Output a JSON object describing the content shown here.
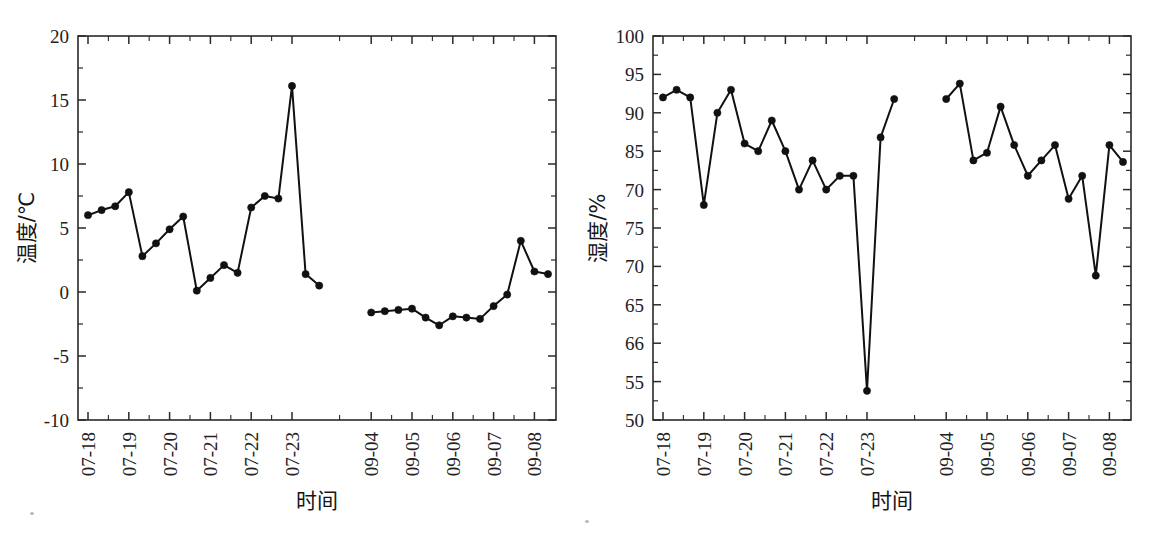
{
  "figure": {
    "background_color": "#ffffff",
    "line_color": "#111111",
    "marker_color": "#111111",
    "axis_color": "#2a2a2a",
    "panel_count": 2
  },
  "chart_data": [
    {
      "type": "line",
      "panel": "left",
      "title": "",
      "xlabel": "时间",
      "ylabel": "温度/℃",
      "ylim": [
        -10,
        20
      ],
      "ytick_labels": [
        "20",
        "15",
        "10",
        "5",
        "0",
        "-5",
        "-10"
      ],
      "ytick_values": [
        20,
        15,
        10,
        5,
        0,
        -5,
        -10
      ],
      "xtick_labels": [
        "07-18",
        "07-19",
        "07-20",
        "07-21",
        "07-22",
        "07-23",
        "09-04",
        "09-05",
        "09-06",
        "09-07",
        "09-08"
      ],
      "grid": false,
      "legend": "none",
      "marker": "filled-circle",
      "has_gap": true,
      "series": [
        {
          "name": "温度 (07-18 ~ 07-23)",
          "segment": 1,
          "x": [
            0.0,
            0.28,
            0.56,
            0.78,
            1.0,
            1.25,
            1.5,
            1.75,
            2.0,
            2.25,
            2.5,
            2.75,
            3.0,
            3.25,
            3.5,
            3.75,
            4.0,
            4.25,
            4.5,
            4.75,
            5.0,
            5.25,
            5.5
          ],
          "values": [
            6.0,
            6.4,
            6.7,
            7.8,
            2.8,
            3.8,
            4.9,
            5.9,
            0.1,
            1.1,
            2.1,
            1.5,
            6.6,
            7.5,
            7.3,
            16.1,
            1.4,
            0.5
          ]
        },
        {
          "name": "温度 (09-04 ~ 09-08)",
          "segment": 2,
          "values": [
            -1.6,
            -1.5,
            -1.4,
            -1.3,
            -2.0,
            -2.6,
            -1.9,
            -2.0,
            -2.1,
            -1.1,
            -0.2,
            4.0,
            1.6,
            1.4
          ]
        }
      ]
    },
    {
      "type": "line",
      "panel": "right",
      "title": "",
      "xlabel": "时间",
      "ylabel": "湿度/%",
      "ylim": [
        50,
        100
      ],
      "ytick_labels": [
        "100",
        "95",
        "90",
        "85",
        "70",
        "75",
        "70",
        "65",
        "66",
        "55",
        "50"
      ],
      "ytick_values": [
        100,
        95,
        90,
        85,
        80,
        75,
        70,
        65,
        60,
        55,
        50
      ],
      "xtick_labels": [
        "07-18",
        "07-19",
        "07-20",
        "07-21",
        "07-22",
        "07-23",
        "09-04",
        "09-05",
        "09-06",
        "09-07",
        "09-08"
      ],
      "grid": false,
      "legend": "none",
      "marker": "filled-circle",
      "has_gap": true,
      "series": [
        {
          "name": "湿度 (07-18 ~ 07-23)",
          "segment": 1,
          "values": [
            92.0,
            93.0,
            92.0,
            78.0,
            90.0,
            93.0,
            86.0,
            85.0,
            89.0,
            85.0,
            80.0,
            83.8,
            80.0,
            81.8,
            81.8,
            53.8,
            86.8,
            91.8
          ]
        },
        {
          "name": "湿度 (09-04 ~ 09-08)",
          "segment": 2,
          "values": [
            91.8,
            93.8,
            83.8,
            84.8,
            90.8,
            85.8,
            81.8,
            83.8,
            85.8,
            78.8,
            81.8,
            68.8,
            85.8,
            83.6
          ]
        }
      ]
    }
  ]
}
